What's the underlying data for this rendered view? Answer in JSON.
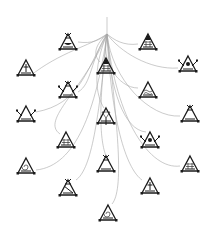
{
  "diagram": {
    "type": "radial-tree",
    "background": "#ffffff",
    "edge_color": "#a8a8a8",
    "glyph_color": "#1a1a1a",
    "root": {
      "id": "root",
      "x": 107,
      "y": 17,
      "stem_end_y": 34
    },
    "nodes": [
      {
        "id": "A",
        "x": 68,
        "y": 42,
        "variant": "crown-bowl"
      },
      {
        "id": "B",
        "x": 148,
        "y": 42,
        "variant": "solid-tip-grid"
      },
      {
        "id": "C",
        "x": 26,
        "y": 68,
        "variant": "figure-bar"
      },
      {
        "id": "D",
        "x": 106,
        "y": 66,
        "variant": "dome-grid"
      },
      {
        "id": "E",
        "x": 188,
        "y": 64,
        "variant": "eye-wings"
      },
      {
        "id": "F",
        "x": 68,
        "y": 90,
        "variant": "crown-arrows"
      },
      {
        "id": "G",
        "x": 148,
        "y": 90,
        "variant": "waves"
      },
      {
        "id": "H",
        "x": 26,
        "y": 114,
        "variant": "crossed-arrows"
      },
      {
        "id": "I",
        "x": 106,
        "y": 116,
        "variant": "double-tri"
      },
      {
        "id": "J",
        "x": 190,
        "y": 114,
        "variant": "hourglass"
      },
      {
        "id": "K",
        "x": 66,
        "y": 140,
        "variant": "pillars"
      },
      {
        "id": "L",
        "x": 150,
        "y": 140,
        "variant": "sun-arrows"
      },
      {
        "id": "M",
        "x": 26,
        "y": 166,
        "variant": "spiral"
      },
      {
        "id": "N",
        "x": 106,
        "y": 164,
        "variant": "crown-tri"
      },
      {
        "id": "O",
        "x": 190,
        "y": 164,
        "variant": "lattice"
      },
      {
        "id": "P",
        "x": 68,
        "y": 188,
        "variant": "hourglass-diag"
      },
      {
        "id": "Q",
        "x": 150,
        "y": 186,
        "variant": "candle"
      },
      {
        "id": "R",
        "x": 108,
        "y": 213,
        "variant": "spiral-base"
      }
    ],
    "edges": [
      {
        "to": "A",
        "d": "M107,34 C100,40 92,44 78,42"
      },
      {
        "to": "B",
        "d": "M107,34 C114,40 124,46 138,44"
      },
      {
        "to": "C",
        "d": "M107,34 C90,46 60,52 30,76"
      },
      {
        "to": "D",
        "d": "M107,34 C96,44 92,54 100,62"
      },
      {
        "to": "E",
        "d": "M107,34 C120,52 150,70 178,68"
      },
      {
        "to": "F",
        "d": "M107,34 C90,60 92,84 78,92"
      },
      {
        "to": "G",
        "d": "M107,34 C100,60 118,88 138,88"
      },
      {
        "to": "H",
        "d": "M107,34 C86,70 80,104 36,112"
      },
      {
        "to": "I",
        "d": "M107,34 C92,70 96,96 104,108"
      },
      {
        "to": "J",
        "d": "M107,34 C112,80 150,118 180,116"
      },
      {
        "to": "K",
        "d": "M107,34 C84,90 40,120 60,134"
      },
      {
        "to": "L",
        "d": "M107,34 C110,90 124,130 146,132"
      },
      {
        "to": "M",
        "d": "M107,34 C96,110 76,166 36,170"
      },
      {
        "to": "N",
        "d": "M107,34 C98,110 100,140 106,156"
      },
      {
        "to": "O",
        "d": "M107,34 C116,120 150,170 180,166"
      },
      {
        "to": "P",
        "d": "M107,34 C98,130 90,170 76,180"
      },
      {
        "to": "Q",
        "d": "M107,34 C112,130 128,170 142,180"
      },
      {
        "to": "R",
        "d": "M107,34 C118,130 124,190 112,204"
      }
    ]
  }
}
